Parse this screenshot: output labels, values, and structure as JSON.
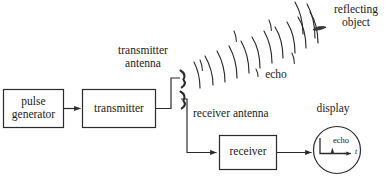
{
  "diagram": {
    "stroke_color": "#2b2b2b",
    "text_color": "#1a1a1a",
    "background": "#ffffff",
    "blocks": [
      {
        "id": "pulse-generator",
        "label": "pulse\ngenerator",
        "line1": "pulse",
        "line2": "generator",
        "x": 3,
        "y": 89,
        "w": 61,
        "h": 39
      },
      {
        "id": "transmitter",
        "label": "transmitter",
        "x": 82,
        "y": 89,
        "w": 74,
        "h": 39
      },
      {
        "id": "receiver",
        "label": "receiver",
        "x": 219,
        "y": 135,
        "w": 58,
        "h": 35
      }
    ],
    "labels": {
      "pulse_generator_line1": "pulse",
      "pulse_generator_line2": "generator",
      "transmitter": "transmitter",
      "receiver": "receiver",
      "transmitter_antenna_line1": "transmitter",
      "transmitter_antenna_line2": "antenna",
      "receiver_antenna": "receiver antenna",
      "echo_wave": "echo",
      "reflecting_object_line1": "reflecting",
      "reflecting_object_line2": "object",
      "display": "display",
      "display_echo": "echo",
      "display_axis_time": "t"
    },
    "antennas": [
      {
        "id": "transmitter-antenna",
        "x": 181,
        "y": 72
      },
      {
        "id": "receiver-antenna",
        "x": 181,
        "y": 95
      }
    ],
    "wave_arcs": {
      "count": 13,
      "description": "outgoing-and-echo-wavefront-arcs"
    },
    "reflecting_object": {
      "x": 313,
      "y": 26,
      "w": 13,
      "h": 4
    },
    "display_scope": {
      "cx": 337,
      "cy": 150,
      "r": 24
    }
  }
}
